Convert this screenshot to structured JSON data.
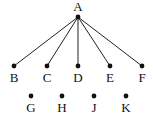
{
  "diagram": {
    "type": "tree",
    "colors": {
      "stroke": "#222222",
      "node": "#111111",
      "label": "#111111",
      "background": "#ffffff"
    },
    "nodes": [
      {
        "id": "A",
        "label": "A",
        "x": 78,
        "y": 17,
        "lx": 78,
        "ly": 11
      },
      {
        "id": "B",
        "label": "B",
        "x": 14,
        "y": 66,
        "lx": 14,
        "ly": 82
      },
      {
        "id": "C",
        "label": "C",
        "x": 47,
        "y": 66,
        "lx": 47,
        "ly": 82
      },
      {
        "id": "D",
        "label": "D",
        "x": 78,
        "y": 66,
        "lx": 78,
        "ly": 82
      },
      {
        "id": "E",
        "label": "E",
        "x": 110,
        "y": 66,
        "lx": 110,
        "ly": 82
      },
      {
        "id": "F",
        "label": "F",
        "x": 142,
        "y": 66,
        "lx": 142,
        "ly": 82
      },
      {
        "id": "G",
        "label": "G",
        "x": 31,
        "y": 96,
        "lx": 31,
        "ly": 112
      },
      {
        "id": "H",
        "label": "H",
        "x": 62,
        "y": 96,
        "lx": 62,
        "ly": 112
      },
      {
        "id": "J",
        "label": "J",
        "x": 94,
        "y": 96,
        "lx": 94,
        "ly": 112
      },
      {
        "id": "K",
        "label": "K",
        "x": 126,
        "y": 96,
        "lx": 126,
        "ly": 112
      }
    ],
    "edges": [
      {
        "from": "A",
        "to": "B"
      },
      {
        "from": "A",
        "to": "C"
      },
      {
        "from": "A",
        "to": "D"
      },
      {
        "from": "A",
        "to": "E"
      },
      {
        "from": "A",
        "to": "F"
      }
    ]
  }
}
